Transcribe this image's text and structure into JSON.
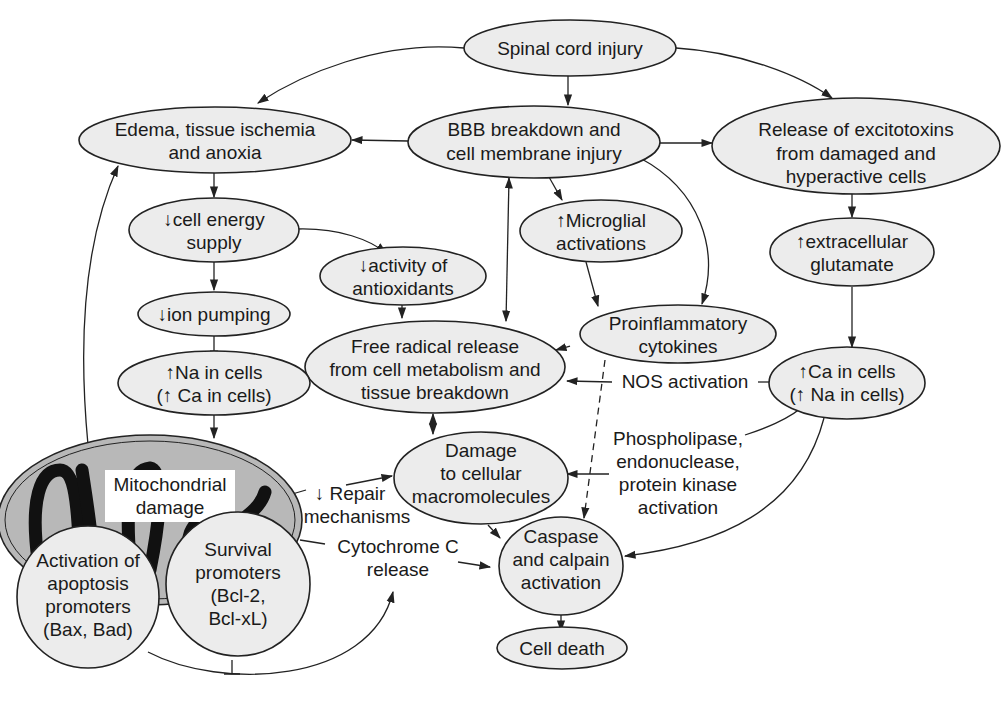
{
  "diagram": {
    "nodes": {
      "spinal_cord_injury": {
        "lines": [
          "Spinal cord injury"
        ]
      },
      "edema": {
        "lines": [
          "Edema, tissue ischemia",
          "and anoxia"
        ]
      },
      "bbb": {
        "lines": [
          "BBB breakdown and",
          "cell membrane injury"
        ]
      },
      "excitotoxins": {
        "lines": [
          "Release of excitotoxins",
          "from damaged and",
          "hyperactive cells"
        ]
      },
      "cell_energy": {
        "lines": [
          "↓cell energy",
          "supply"
        ]
      },
      "microglial": {
        "lines": [
          "↑Microglial",
          "activations"
        ]
      },
      "glutamate": {
        "lines": [
          "↑extracellular",
          "glutamate"
        ]
      },
      "antioxidants": {
        "lines": [
          "↓activity of",
          "antioxidants"
        ]
      },
      "ion_pumping": {
        "lines": [
          "↓ion pumping"
        ]
      },
      "cytokines": {
        "lines": [
          "Proinflammatory",
          "cytokines"
        ]
      },
      "free_radical": {
        "lines": [
          "Free radical release",
          "from cell metabolism and",
          "tissue breakdown"
        ]
      },
      "na_cells": {
        "lines": [
          "↑Na in cells",
          "(↑ Ca in cells)"
        ]
      },
      "ca_cells": {
        "lines": [
          "↑Ca in cells",
          "(↑ Na in cells)"
        ]
      },
      "macromolecules": {
        "lines": [
          "Damage",
          "to cellular",
          "macromolecules"
        ]
      },
      "mitochondrial": {
        "lines": [
          "Mitochondrial",
          "damage"
        ]
      },
      "apoptosis": {
        "lines": [
          "Activation of",
          "apoptosis",
          "promoters",
          "(Bax, Bad)"
        ]
      },
      "survival": {
        "lines": [
          "Survival",
          "promoters",
          "(Bcl-2,",
          "Bcl-xL)"
        ]
      },
      "caspase": {
        "lines": [
          "Caspase",
          "and calpain",
          "activation"
        ]
      },
      "cell_death": {
        "lines": [
          "Cell death"
        ]
      }
    },
    "edge_labels": {
      "nos": "NOS activation",
      "phospholipase": [
        "Phospholipase,",
        "endonuclease,",
        "protein kinase",
        "activation"
      ],
      "repair": [
        "↓ Repair",
        "mechanisms"
      ],
      "cytochrome": [
        "Cytochrome C",
        "release"
      ]
    },
    "colors": {
      "node_fill": "#ececec",
      "stroke": "#222222",
      "mito_fill": "#b8b8b8"
    }
  }
}
